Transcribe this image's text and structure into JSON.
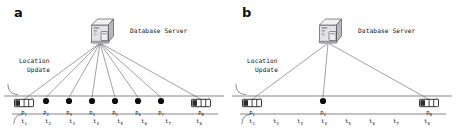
{
  "figure": {
    "background": "#ffffff",
    "line_color": "#55555a",
    "dot_color": "#0d0d0d",
    "text_color": "#111111"
  },
  "panels": [
    {
      "id": "a",
      "label": "a",
      "server_label": "Database Server",
      "location_update_line1": "Location",
      "location_update_line2": "Update",
      "server_x": 100,
      "server_y": 30,
      "road_y": 96,
      "update_line_count": 8,
      "nodes": [
        {
          "kind": "car",
          "x": 24,
          "label": "p",
          "sub": "1",
          "connected": true
        },
        {
          "kind": "dot",
          "x": 46,
          "label": "p",
          "sub": "2",
          "connected": true
        },
        {
          "kind": "dot",
          "x": 69,
          "label": "p",
          "sub": "3",
          "connected": true
        },
        {
          "kind": "dot",
          "x": 92,
          "label": "p",
          "sub": "4",
          "connected": true
        },
        {
          "kind": "dot",
          "x": 115,
          "label": "p",
          "sub": "5",
          "connected": true
        },
        {
          "kind": "dot",
          "x": 138,
          "label": "p",
          "sub": "6",
          "connected": true
        },
        {
          "kind": "dot",
          "x": 161,
          "label": "p",
          "sub": "7",
          "connected": true
        },
        {
          "kind": "car",
          "x": 201,
          "label": "p",
          "sub": "8",
          "connected": true
        }
      ],
      "times": [
        {
          "x": 24,
          "label": "t",
          "sub": "1"
        },
        {
          "x": 48,
          "label": "t",
          "sub": "2"
        },
        {
          "x": 72,
          "label": "t",
          "sub": "3"
        },
        {
          "x": 96,
          "label": "t",
          "sub": "4"
        },
        {
          "x": 120,
          "label": "t",
          "sub": "5"
        },
        {
          "x": 144,
          "label": "t",
          "sub": "6"
        },
        {
          "x": 168,
          "label": "t",
          "sub": "7"
        },
        {
          "x": 199,
          "label": "t",
          "sub": "8"
        }
      ]
    },
    {
      "id": "b",
      "label": "b",
      "server_label": "Database Server",
      "location_update_line1": "Location",
      "location_update_line2": "Update",
      "server_x": 100,
      "server_y": 30,
      "road_y": 96,
      "update_line_count": 3,
      "nodes": [
        {
          "kind": "car",
          "x": 24,
          "label": "p",
          "sub": "1",
          "connected": true
        },
        {
          "kind": "dot",
          "x": 95,
          "label": "p",
          "sub": "4",
          "connected": true
        },
        {
          "kind": "car",
          "x": 201,
          "label": "p",
          "sub": "8",
          "connected": true
        }
      ],
      "times": [
        {
          "x": 24,
          "label": "t",
          "sub": "1"
        },
        {
          "x": 48,
          "label": "t",
          "sub": "2"
        },
        {
          "x": 72,
          "label": "t",
          "sub": "3"
        },
        {
          "x": 96,
          "label": "t",
          "sub": "4"
        },
        {
          "x": 120,
          "label": "t",
          "sub": "5"
        },
        {
          "x": 144,
          "label": "t",
          "sub": "6"
        },
        {
          "x": 168,
          "label": "t",
          "sub": "7"
        },
        {
          "x": 199,
          "label": "t",
          "sub": "8"
        }
      ]
    }
  ]
}
